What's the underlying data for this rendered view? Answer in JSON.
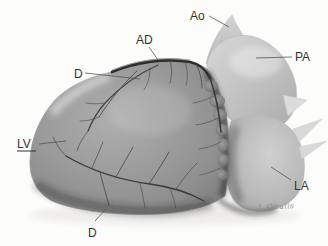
{
  "illustration": {
    "labels": {
      "ao": "Ao",
      "pa": "PA",
      "ad": "AD",
      "d_upper": "D",
      "lv": "LV",
      "la": "LA",
      "d_lower": "D"
    },
    "signature": "J. Círulis",
    "colors": {
      "background": "#fcfcfb",
      "label_ink": "#333333",
      "leader_line": "#555555",
      "heart_body_gray": "#9a9a9a",
      "vessel_ink": "#3a3a3a"
    }
  }
}
